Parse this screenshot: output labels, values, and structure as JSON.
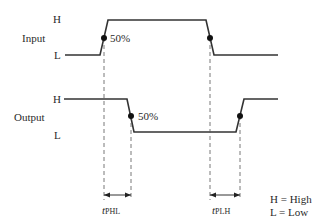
{
  "diagram": {
    "type": "timing-diagram",
    "signals": [
      {
        "name": "Input",
        "levels": {
          "high": "H",
          "low": "L"
        },
        "waveform": "low-high-low",
        "transitions": [
          {
            "edge": "rising",
            "marker": "50%"
          },
          {
            "edge": "falling",
            "marker": ""
          }
        ]
      },
      {
        "name": "Output",
        "levels": {
          "high": "H",
          "low": "L"
        },
        "waveform": "high-low-high",
        "transitions": [
          {
            "edge": "falling",
            "marker": "50%"
          },
          {
            "edge": "rising",
            "marker": ""
          }
        ]
      }
    ],
    "delays": [
      {
        "symbol": "t",
        "subscript": "PHL"
      },
      {
        "symbol": "t",
        "subscript": "PLH"
      }
    ],
    "legend": [
      "H = High",
      "L = Low"
    ],
    "colors": {
      "line": "#333333",
      "dash": "#555555",
      "dot": "#111111"
    }
  },
  "labels": {
    "input_name": "Input",
    "input_high": "H",
    "input_low": "L",
    "input_percent": "50%",
    "output_name": "Output",
    "output_high": "H",
    "output_low": "L",
    "output_percent": "50%",
    "tphl_t": "t",
    "tphl_sub": "PHL",
    "tplh_t": "t",
    "tplh_sub": "PLH",
    "legend_high": "H = High",
    "legend_low": "L = Low"
  }
}
